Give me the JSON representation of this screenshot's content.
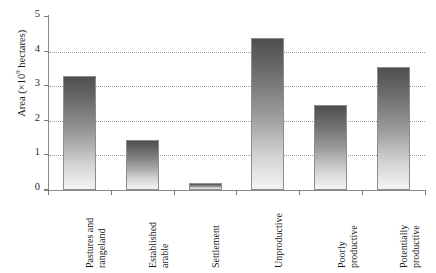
{
  "chart_data": {
    "type": "bar",
    "title": "",
    "xlabel": "",
    "ylabel": "Area (×10⁹ hectares)",
    "ylabel_prefix": "Area (×10",
    "ylabel_exponent": "9",
    "ylabel_suffix": " hectares)",
    "categories": [
      "Pastures and rangeland",
      "Established arable",
      "Settlement",
      "Unproductive",
      "Poorly productive",
      "Potentially productive"
    ],
    "category_lines": [
      [
        "Pastures and",
        "rangeland"
      ],
      [
        "Established",
        "arable"
      ],
      [
        "Settlement"
      ],
      [
        "Unproductive"
      ],
      [
        "Poorly",
        "productive"
      ],
      [
        "Potentially",
        "productive"
      ]
    ],
    "values": [
      3.3,
      1.45,
      0.2,
      4.4,
      2.45,
      3.55
    ],
    "ylim": [
      0,
      5
    ],
    "ytick_labels": [
      "0",
      "1",
      "2",
      "3",
      "4",
      "5"
    ],
    "ytick_values": [
      0,
      1,
      2,
      3,
      4,
      5
    ],
    "grid": "horizontal-dotted",
    "legend": "none",
    "bar_fill_top_color": "#4f4f4f",
    "bar_fill_bottom_color": "#f4f4f4",
    "bar_border_color": "#8d8d8d",
    "axis_color": "#8a8a8a",
    "gridline_color": "#9a9a9a",
    "background_color": "#ffffff"
  }
}
